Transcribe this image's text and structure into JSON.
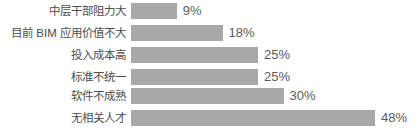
{
  "chart_data": {
    "type": "bar",
    "orientation": "horizontal",
    "title": "",
    "xlabel": "",
    "ylabel": "",
    "grid": false,
    "legend": false,
    "xlim": [
      0,
      48
    ],
    "categories": [
      "中层干部阻力大",
      "目前 BIM 应用价值不大",
      "投入成本高",
      "标准不统一",
      "软件不成熟",
      "无相关人才"
    ],
    "values": [
      9,
      18,
      25,
      25,
      30,
      48
    ],
    "value_labels": [
      "9%",
      "18%",
      "25%",
      "25%",
      "30%",
      "48%"
    ],
    "colors": {
      "bar": "#a8a8a8",
      "value_text": "#5a5a5a",
      "category_text": "#4d4d4d",
      "background": "#ffffff"
    }
  },
  "rows": [
    {
      "label": "中层干部阻力大",
      "value": 9,
      "value_label": "9%"
    },
    {
      "label": "目前 BIM 应用价值不大",
      "value": 18,
      "value_label": "18%"
    },
    {
      "label": "投入成本高",
      "value": 25,
      "value_label": "25%"
    },
    {
      "label": "标准不统一",
      "value": 25,
      "value_label": "25%"
    },
    {
      "label": "软件不成熟",
      "value": 30,
      "value_label": "30%"
    },
    {
      "label": "无相关人才",
      "value": 48,
      "value_label": "48%"
    }
  ]
}
